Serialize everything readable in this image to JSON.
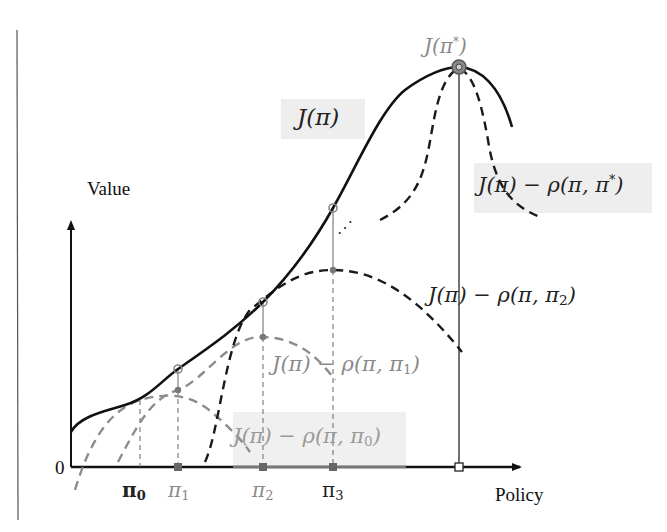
{
  "diagram": {
    "axes": {
      "y_label": "Value",
      "x_label": "Policy",
      "origin_label": "0"
    },
    "ticks": [
      {
        "id": "pi0",
        "base": "π",
        "sub": "0",
        "x": 138,
        "color": "#111111"
      },
      {
        "id": "pi1",
        "base": "π",
        "sub": "1",
        "x": 178,
        "color": "#8a8a8a"
      },
      {
        "id": "pi2",
        "base": "π",
        "sub": "2",
        "x": 263,
        "color": "#8a8a8a"
      },
      {
        "id": "pi3",
        "base": "π",
        "sub": "3",
        "x": 333,
        "color": "#222222"
      }
    ],
    "labels": {
      "objective": "J(π)",
      "optimum": {
        "base": "J(π",
        "sup": "*",
        "close": ")"
      },
      "surrogate_star": {
        "base": "J(π) − ρ(π, π",
        "sup": "*",
        "close": ")"
      },
      "surrogate_2": {
        "base": "J(π) − ρ(π, π",
        "sub": "2",
        "close": ")"
      },
      "surrogate_1": {
        "base": "J(π) − ρ(π, π",
        "sub": "1",
        "close": ")"
      },
      "surrogate_0": {
        "base": "J(π) − ρ(π, π",
        "sub": "0",
        "close": ")"
      }
    },
    "ellipsis": "⋰",
    "colors": {
      "objective_curve": "#111111",
      "surrogate_dark": "#1a1a1a",
      "surrogate_grey": "#8c8c8c",
      "label_box": "#eeeeee",
      "guide_line": "#777777"
    }
  }
}
